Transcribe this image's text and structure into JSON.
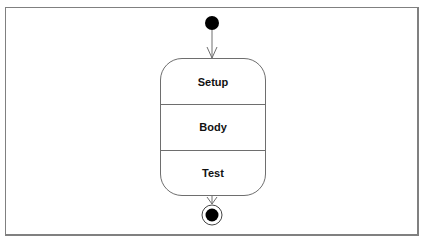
{
  "diagram": {
    "type": "uml-state",
    "initial_node": {
      "shape": "filled-circle"
    },
    "final_node": {
      "shape": "bullseye"
    },
    "state": {
      "compartments": [
        {
          "label": "Setup"
        },
        {
          "label": "Body"
        },
        {
          "label": "Test"
        }
      ]
    },
    "transitions": [
      {
        "from": "initial",
        "to": "state"
      },
      {
        "from": "state",
        "to": "final"
      }
    ],
    "colors": {
      "line": "#6e6e6e",
      "node": "#000000",
      "frame": "#808080"
    }
  }
}
